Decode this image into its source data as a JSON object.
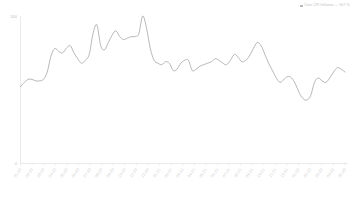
{
  "legend": {
    "marker": "square-marker",
    "label": "Core CPI Inflation — YoY %"
  },
  "chart_data": {
    "type": "line",
    "title": "",
    "subtitle": "",
    "xlabel": "",
    "ylabel": "",
    "ylim": [
      0,
      100
    ],
    "yticks": [
      0,
      100
    ],
    "ytick_labels": [
      "0",
      "100"
    ],
    "grid": false,
    "legend_position": "top-right",
    "line_color": "#9a9a9a",
    "categories": [
      "01-20",
      "02-20",
      "03-20",
      "04-20",
      "05-20",
      "06-20",
      "07-20",
      "08-20",
      "09-20",
      "10-20",
      "11-20",
      "12-20",
      "01-21",
      "02-21",
      "03-21",
      "04-21",
      "05-21",
      "06-21",
      "07-21",
      "08-21",
      "09-21",
      "10-21",
      "11-21",
      "12-21",
      "01-22",
      "02-22",
      "03-22",
      "04-22",
      "05-22"
    ],
    "series": [
      {
        "name": "Core CPI Inflation — YoY %",
        "values": [
          52,
          56,
          57,
          56,
          57,
          78,
          76,
          80,
          71,
          68,
          74,
          94,
          77,
          87,
          90,
          84,
          85,
          86,
          100,
          70,
          67,
          68,
          63,
          70,
          70,
          63,
          66,
          68,
          71
        ]
      }
    ],
    "dense_points": [
      52,
      55,
      57,
      57,
      56,
      56,
      57,
      62,
      73,
      78,
      76,
      75,
      78,
      80,
      75,
      71,
      68,
      70,
      74,
      88,
      94,
      80,
      77,
      82,
      87,
      90,
      86,
      84,
      85,
      86,
      86,
      88,
      100,
      92,
      78,
      70,
      68,
      67,
      69,
      68,
      63,
      64,
      68,
      70,
      70,
      63,
      64,
      66,
      67,
      68,
      69,
      71,
      70,
      68,
      67,
      70,
      74,
      72,
      69,
      70,
      73,
      78,
      82,
      80,
      74,
      68,
      63,
      58,
      55,
      57,
      59,
      58,
      54,
      48,
      44,
      43,
      46,
      55,
      58,
      56,
      55,
      58,
      62,
      65,
      64,
      62
    ]
  },
  "axes": {
    "y_top_label": "100",
    "y_bottom_label": "0"
  }
}
